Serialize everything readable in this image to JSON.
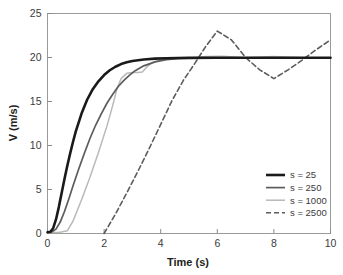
{
  "chart_data": {
    "type": "line",
    "title": "",
    "xlabel": "Time (s)",
    "ylabel": "V (m/s)",
    "xlim": [
      0,
      10
    ],
    "ylim": [
      0,
      25
    ],
    "xticks": [
      0,
      2,
      4,
      6,
      8,
      10
    ],
    "yticks": [
      0,
      5,
      10,
      15,
      20,
      25
    ],
    "xtick_labels": [
      "0",
      "2",
      "4",
      "6",
      "8",
      "10"
    ],
    "ytick_labels": [
      "0",
      "5",
      "10",
      "15",
      "20",
      "25"
    ],
    "grid": false,
    "legend_position": "lower right",
    "series": [
      {
        "name": "s = 25",
        "color": "#1a1a1a",
        "width": 2.6,
        "dash": "none",
        "x": [
          0,
          0.1,
          0.2,
          0.3,
          0.4,
          0.5,
          0.6,
          0.7,
          0.8,
          0.9,
          1.0,
          1.2,
          1.4,
          1.6,
          1.8,
          2.0,
          2.2,
          2.4,
          2.6,
          2.8,
          3.0,
          3.4,
          3.8,
          4.2,
          4.6,
          5.0,
          6.0,
          7.0,
          8.0,
          9.0,
          10.0
        ],
        "y": [
          0.15,
          0.2,
          0.6,
          1.6,
          3.0,
          4.6,
          6.2,
          7.7,
          9.1,
          10.4,
          11.6,
          13.6,
          15.2,
          16.4,
          17.3,
          18.0,
          18.55,
          18.95,
          19.25,
          19.45,
          19.6,
          19.78,
          19.87,
          19.92,
          19.95,
          19.96,
          19.97,
          19.97,
          19.97,
          19.97,
          19.97
        ]
      },
      {
        "name": "s = 250",
        "color": "#5c5c5c",
        "width": 1.7,
        "dash": "none",
        "x": [
          0,
          0.15,
          0.3,
          0.45,
          0.6,
          0.75,
          0.9,
          1.1,
          1.3,
          1.5,
          1.7,
          1.9,
          2.1,
          2.3,
          2.5,
          2.7,
          2.9,
          3.1,
          3.4,
          3.8,
          4.2,
          4.6,
          5.0,
          5.5,
          6.0,
          6.5,
          7.0,
          8.0,
          9.0,
          10.0
        ],
        "y": [
          0.15,
          0.18,
          0.5,
          1.3,
          2.5,
          3.9,
          5.4,
          7.3,
          9.1,
          10.8,
          12.3,
          13.6,
          14.8,
          15.8,
          16.7,
          17.4,
          18.0,
          18.5,
          19.05,
          19.5,
          19.75,
          19.88,
          19.93,
          19.96,
          19.97,
          19.97,
          19.97,
          19.97,
          19.97,
          19.97
        ]
      },
      {
        "name": "s = 1000",
        "color": "#b9b9b9",
        "width": 1.5,
        "dash": "none",
        "x": [
          0,
          0.4,
          0.7,
          0.9,
          1.2,
          1.5,
          1.8,
          2.1,
          2.3,
          2.45,
          2.6,
          2.8,
          3.0,
          3.2,
          3.35,
          3.5,
          3.7,
          3.9,
          4.2,
          4.6,
          5.0,
          5.6,
          6.2,
          7.0,
          8.0,
          9.0,
          10.0
        ],
        "y": [
          0.1,
          0.12,
          0.3,
          1.4,
          3.8,
          6.4,
          9.2,
          12.2,
          14.5,
          16.4,
          17.6,
          18.2,
          18.3,
          18.3,
          18.35,
          18.9,
          19.4,
          19.65,
          19.82,
          19.92,
          19.95,
          20.1,
          20.15,
          19.98,
          20.1,
          19.98,
          19.97
        ]
      },
      {
        "name": "s = 2500",
        "color": "#5c5c5c",
        "width": 1.6,
        "dash": "5,3",
        "x": [
          2.0,
          2.4,
          2.8,
          3.2,
          3.6,
          4.0,
          4.4,
          4.8,
          5.2,
          5.6,
          6.0,
          6.5,
          7.0,
          7.5,
          8.0,
          8.5,
          9.0,
          9.5,
          10.0
        ],
        "y": [
          0.0,
          2.2,
          4.6,
          7.1,
          9.7,
          12.4,
          15.1,
          17.4,
          19.3,
          21.3,
          23.0,
          22.0,
          20.0,
          18.6,
          17.6,
          18.6,
          19.7,
          20.9,
          22.0
        ]
      }
    ]
  },
  "legend": {
    "entries": [
      {
        "label": "s = 25"
      },
      {
        "label": "s = 250"
      },
      {
        "label": "s = 1000"
      },
      {
        "label": "s = 2500"
      }
    ]
  }
}
